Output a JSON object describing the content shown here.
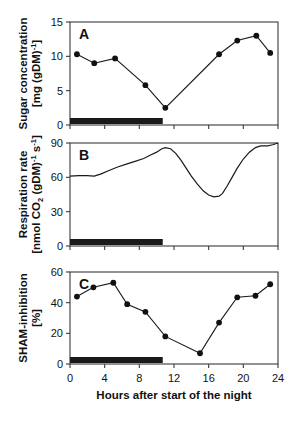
{
  "figure": {
    "xaxis": {
      "label": "Hours after start of the night",
      "ticks": [
        0,
        4,
        8,
        12,
        16,
        20,
        24
      ],
      "range": [
        0,
        24
      ]
    },
    "night_bar": {
      "start": 0,
      "end": 10.7,
      "color": "#1a1a1a"
    },
    "panels": [
      {
        "letter": "A",
        "ylabel_line1": "Sugar concentration",
        "ylabel_line2": "[mg (gDM)",
        "ylabel_line2_sup": "-1",
        "ylabel_line2_tail": "]",
        "yticks": [
          0,
          5,
          10,
          15
        ],
        "ylim": [
          0,
          15
        ]
      },
      {
        "letter": "B",
        "ylabel_line1": "Respiration rate",
        "ylabel_line2": "[nmol CO",
        "ylabel_line2_sub": "2",
        "ylabel_line2_mid": " (gDM)",
        "ylabel_line2_sup1": "-1",
        "ylabel_line2_mid2": " s",
        "ylabel_line2_sup2": "-1",
        "ylabel_line2_tail": "]",
        "yticks": [
          0,
          30,
          60,
          90
        ],
        "ylim": [
          0,
          90
        ]
      },
      {
        "letter": "C",
        "ylabel_line1": "SHAM-inhibition",
        "ylabel_line2": "[%]",
        "yticks": [
          0,
          20,
          40,
          60
        ],
        "ylim": [
          0,
          60
        ]
      }
    ]
  },
  "chart_data": [
    {
      "type": "line",
      "panel": "A",
      "title": "Sugar concentration",
      "xlabel": "Hours after start of the night",
      "ylabel": "Sugar concentration [mg (gDM)-1]",
      "xlim": [
        0,
        24
      ],
      "ylim": [
        0,
        15
      ],
      "xticks": [
        0,
        4,
        8,
        12,
        16,
        20,
        24
      ],
      "yticks": [
        0,
        5,
        10,
        15
      ],
      "grid": false,
      "legend": "none",
      "markers": "filled-circle",
      "x": [
        0.8,
        2.8,
        5.2,
        8.7,
        11.0,
        15.0,
        17.2,
        19.3,
        21.5,
        23.1
      ],
      "y": [
        10.3,
        9.0,
        9.7,
        5.8,
        2.5,
        2.5,
        10.3,
        12.3,
        13.0,
        10.5
      ],
      "series": [
        {
          "name": "Sugar concentration",
          "points": [
            {
              "x": 0.8,
              "y": 10.3
            },
            {
              "x": 2.8,
              "y": 9.0
            },
            {
              "x": 5.2,
              "y": 9.7
            },
            {
              "x": 8.7,
              "y": 5.8
            },
            {
              "x": 11.0,
              "y": 2.5
            },
            {
              "x": 17.2,
              "y": 10.3
            },
            {
              "x": 19.3,
              "y": 12.3
            },
            {
              "x": 21.5,
              "y": 13.0
            },
            {
              "x": 23.1,
              "y": 10.5
            }
          ]
        }
      ]
    },
    {
      "type": "line",
      "panel": "B",
      "title": "Respiration rate",
      "xlabel": "Hours after start of the night",
      "ylabel": "Respiration rate [nmol CO2 (gDM)-1 s-1]",
      "xlim": [
        0,
        24
      ],
      "ylim": [
        0,
        90
      ],
      "xticks": [
        0,
        4,
        8,
        12,
        16,
        20,
        24
      ],
      "yticks": [
        0,
        30,
        60,
        90
      ],
      "grid": false,
      "legend": "none",
      "markers": "none",
      "series": [
        {
          "name": "Respiration rate",
          "points": [
            {
              "x": 0.0,
              "y": 61.0
            },
            {
              "x": 1.0,
              "y": 61.5
            },
            {
              "x": 2.0,
              "y": 61.5
            },
            {
              "x": 2.8,
              "y": 61.0
            },
            {
              "x": 3.6,
              "y": 63.0
            },
            {
              "x": 4.5,
              "y": 66.0
            },
            {
              "x": 5.5,
              "y": 69.0
            },
            {
              "x": 6.5,
              "y": 71.5
            },
            {
              "x": 7.5,
              "y": 74.0
            },
            {
              "x": 8.5,
              "y": 76.5
            },
            {
              "x": 9.3,
              "y": 79.5
            },
            {
              "x": 10.0,
              "y": 82.0
            },
            {
              "x": 10.6,
              "y": 85.0
            },
            {
              "x": 11.0,
              "y": 86.0
            },
            {
              "x": 11.6,
              "y": 85.0
            },
            {
              "x": 12.2,
              "y": 81.0
            },
            {
              "x": 12.8,
              "y": 75.0
            },
            {
              "x": 13.4,
              "y": 68.0
            },
            {
              "x": 14.0,
              "y": 61.0
            },
            {
              "x": 14.7,
              "y": 54.0
            },
            {
              "x": 15.4,
              "y": 48.0
            },
            {
              "x": 16.0,
              "y": 44.5
            },
            {
              "x": 16.6,
              "y": 43.0
            },
            {
              "x": 17.2,
              "y": 43.5
            },
            {
              "x": 17.6,
              "y": 46.0
            },
            {
              "x": 18.1,
              "y": 52.0
            },
            {
              "x": 18.7,
              "y": 60.0
            },
            {
              "x": 19.3,
              "y": 68.0
            },
            {
              "x": 20.0,
              "y": 76.0
            },
            {
              "x": 20.7,
              "y": 82.0
            },
            {
              "x": 21.4,
              "y": 86.0
            },
            {
              "x": 22.0,
              "y": 87.5
            },
            {
              "x": 22.8,
              "y": 87.5
            },
            {
              "x": 23.4,
              "y": 88.5
            },
            {
              "x": 24.0,
              "y": 90.0
            }
          ]
        }
      ]
    },
    {
      "type": "line",
      "panel": "C",
      "title": "SHAM-inhibition",
      "xlabel": "Hours after start of the night",
      "ylabel": "SHAM-inhibition [%]",
      "xlim": [
        0,
        24
      ],
      "ylim": [
        0,
        60
      ],
      "xticks": [
        0,
        4,
        8,
        12,
        16,
        20,
        24
      ],
      "yticks": [
        0,
        20,
        40,
        60
      ],
      "grid": false,
      "legend": "none",
      "markers": "filled-circle",
      "x": [
        0.8,
        2.7,
        5.0,
        6.6,
        8.7,
        11.0,
        15.0,
        17.2,
        19.3,
        21.4,
        23.1
      ],
      "y": [
        44,
        50,
        53,
        39,
        34,
        18,
        7,
        27,
        43.5,
        44.5,
        52
      ],
      "series": [
        {
          "name": "SHAM-inhibition",
          "points": [
            {
              "x": 0.8,
              "y": 44
            },
            {
              "x": 2.7,
              "y": 50
            },
            {
              "x": 5.0,
              "y": 53
            },
            {
              "x": 6.6,
              "y": 39
            },
            {
              "x": 8.7,
              "y": 34
            },
            {
              "x": 11.0,
              "y": 18
            },
            {
              "x": 15.0,
              "y": 7
            },
            {
              "x": 17.2,
              "y": 27
            },
            {
              "x": 19.3,
              "y": 43.5
            },
            {
              "x": 21.4,
              "y": 44.5
            },
            {
              "x": 23.1,
              "y": 52
            }
          ]
        }
      ]
    }
  ]
}
